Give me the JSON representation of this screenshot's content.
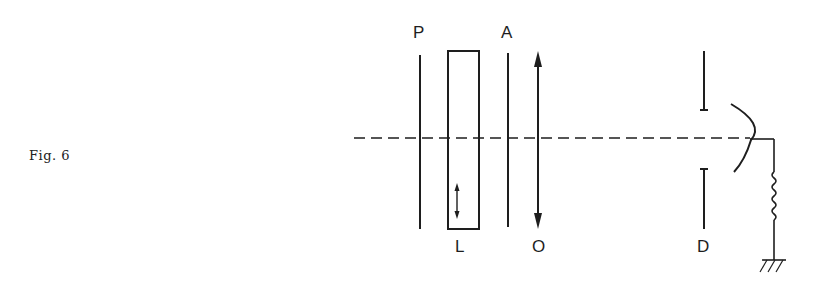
{
  "figure": {
    "caption": "Fig. 6",
    "ink_color": "#1e1e1e",
    "labels": {
      "polarizer": "P",
      "analyzer": "A",
      "sample_cell": "L",
      "lens": "O",
      "aperture": "D"
    },
    "components": [
      {
        "id": "polarizer",
        "label": "P",
        "type": "vertical-line"
      },
      {
        "id": "sample_cell",
        "label": "L",
        "type": "rectangle-with-double-arrow"
      },
      {
        "id": "analyzer",
        "label": "A",
        "type": "vertical-line"
      },
      {
        "id": "lens",
        "label": "O",
        "type": "double-headed-arrow"
      },
      {
        "id": "aperture",
        "label": "D",
        "type": "split-slit"
      },
      {
        "id": "detector",
        "label": "",
        "type": "curved-photocathode"
      },
      {
        "id": "resistor",
        "label": "",
        "type": "zigzag-resistor"
      },
      {
        "id": "ground",
        "label": "",
        "type": "ground-symbol"
      }
    ],
    "optical_axis": "dashed"
  }
}
